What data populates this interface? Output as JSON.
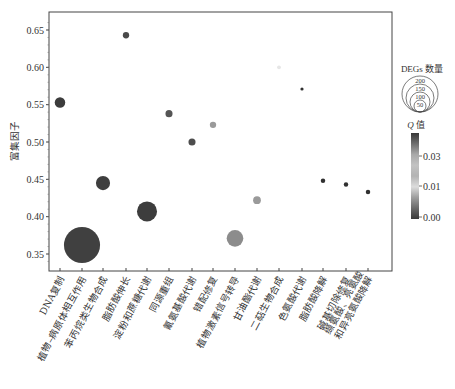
{
  "chart_data": {
    "type": "scatter",
    "title": "",
    "xlabel": "",
    "ylabel": "富集因子",
    "ylim": [
      0.325,
      0.672
    ],
    "yticks": [
      0.35,
      0.4,
      0.45,
      0.5,
      0.55,
      0.6,
      0.65
    ],
    "ytick_labels": [
      "0.35",
      "0.40",
      "0.45",
      "0.50",
      "0.55",
      "0.60",
      "0.65"
    ],
    "grid": false,
    "categories": [
      "DNA复制",
      "植物–病原体相互作用",
      "苯丙烷类生物合成",
      "脂肪酸伸长",
      "淀粉和蔗糖代谢",
      "同源重组",
      "氰氨基酸代谢",
      "错配修复",
      "植物激素信号转导",
      "甘油酯代谢",
      "二萜生物合成",
      "色氨酸代谢",
      "脂肪酸降解",
      "碱基切除修复",
      "缬氨酸、亮氨酸和异亮氨酸降解"
    ],
    "cat_label_lines": [
      [
        "DNA复制"
      ],
      [
        "植物–病原体相互作用"
      ],
      [
        "苯丙烷类生物合成"
      ],
      [
        "脂肪酸伸长"
      ],
      [
        "淀粉和蔗糖代谢"
      ],
      [
        "同源重组"
      ],
      [
        "氰氨基酸代谢"
      ],
      [
        "错配修复"
      ],
      [
        "植物激素信号转导"
      ],
      [
        "甘油酯代谢"
      ],
      [
        "二萜生物合成"
      ],
      [
        "色氨酸代谢"
      ],
      [
        "脂肪酸降解"
      ],
      [
        "碱基切除修复"
      ],
      [
        "缬氨酸、亮氨酸",
        "和异亮氨酸降解"
      ]
    ],
    "values": [
      0.553,
      0.362,
      0.445,
      0.643,
      0.407,
      0.538,
      0.5,
      0.523,
      0.371,
      0.422,
      0.6,
      0.571,
      0.448,
      0.443,
      0.433
    ],
    "deg_counts": [
      22,
      260,
      40,
      8,
      80,
      10,
      10,
      8,
      55,
      12,
      3,
      2,
      4,
      4,
      4
    ],
    "q_values": [
      0.001,
      0.0,
      0.001,
      0.002,
      0.001,
      0.003,
      0.002,
      0.012,
      0.018,
      0.02,
      0.03,
      0.035,
      0.038,
      0.038,
      0.04
    ],
    "point_colors": [
      "#3c3c3c",
      "#404040",
      "#3e3e3e",
      "#4a4a4a",
      "#3d3d3d",
      "#555555",
      "#4d4d4d",
      "#9a9a9a",
      "#8c8c8c",
      "#9a9a9a",
      "#e6e6e6",
      "#303030",
      "#303030",
      "#303030",
      "#303030"
    ],
    "legend": {
      "size_title": "DEGs 数量",
      "size_levels": [
        "200",
        "150",
        "100",
        "50"
      ],
      "color_title": "Q 值",
      "color_title_q": "Q",
      "color_title_rest": " 值",
      "color_ticks": [
        "0.03",
        "0.01",
        "0.00"
      ],
      "colorbar_stops": [
        "#383838",
        "#6e6e6e",
        "#a9a9a9",
        "#c2c2c2",
        "#b3b3b3",
        "#dcdcdc",
        "#9e9e9e",
        "#6a6a6a",
        "#3a3a3a"
      ]
    }
  }
}
